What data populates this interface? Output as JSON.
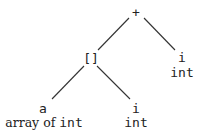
{
  "diagram": {
    "type": "tree",
    "line_color": "#333333",
    "text_color": "#222222",
    "nodes": {
      "root": {
        "label": "+"
      },
      "index": {
        "label": "[]"
      },
      "right_i": {
        "label": "i",
        "type": "int"
      },
      "a": {
        "label": "a",
        "type_prefix": "array of",
        "type": "int"
      },
      "mid_i": {
        "label": "i",
        "type": "int"
      }
    },
    "edges": [
      {
        "from": "root",
        "to": "index"
      },
      {
        "from": "root",
        "to": "right_i"
      },
      {
        "from": "index",
        "to": "a"
      },
      {
        "from": "index",
        "to": "mid_i"
      }
    ]
  }
}
